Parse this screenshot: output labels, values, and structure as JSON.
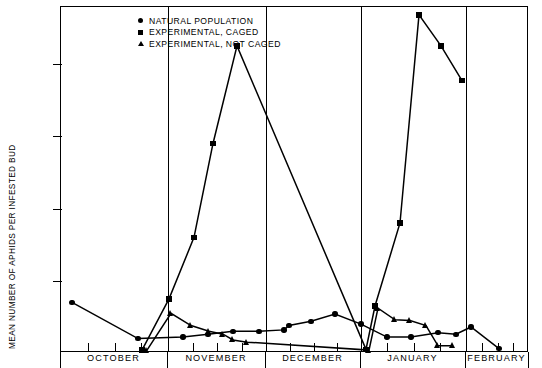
{
  "chart_data": {
    "type": "line",
    "title": "",
    "xlabel": "",
    "ylabel": "MEAN NUMBER OF APHIDS PER INFESTED BUD",
    "ylim": [
      0,
      470
    ],
    "yticks": [
      0,
      100,
      200,
      300,
      400
    ],
    "ytick_labels": [
      "0",
      "100",
      "200",
      "300",
      "400"
    ],
    "grid": false,
    "legend_position": "top-left",
    "xaxis": {
      "type": "time",
      "month_bands": [
        "OCTOBER",
        "NOVEMBER",
        "DECEMBER",
        "JANUARY",
        "FEBRUARY"
      ],
      "band_boundaries_px": [
        60,
        167,
        265,
        360,
        465,
        528
      ],
      "tick_interval": "weekly"
    },
    "series": [
      {
        "name": "NATURAL POPULATION",
        "marker": "circle",
        "points": [
          {
            "x": 71,
            "y": 70
          },
          {
            "x": 137,
            "y": 20
          },
          {
            "x": 182,
            "y": 22
          },
          {
            "x": 207,
            "y": 26
          },
          {
            "x": 232,
            "y": 30
          },
          {
            "x": 258,
            "y": 30
          },
          {
            "x": 283,
            "y": 32
          },
          {
            "x": 288,
            "y": 38
          },
          {
            "x": 310,
            "y": 44
          },
          {
            "x": 334,
            "y": 54
          },
          {
            "x": 360,
            "y": 40
          },
          {
            "x": 386,
            "y": 22
          },
          {
            "x": 410,
            "y": 22
          },
          {
            "x": 437,
            "y": 28
          },
          {
            "x": 455,
            "y": 26
          },
          {
            "x": 470,
            "y": 36
          },
          {
            "x": 498,
            "y": 6
          }
        ]
      },
      {
        "name": "EXPERIMENTAL, CAGED",
        "marker": "square",
        "points": [
          {
            "x": 141,
            "y": 4
          },
          {
            "x": 168,
            "y": 75
          },
          {
            "x": 193,
            "y": 160
          },
          {
            "x": 212,
            "y": 290
          },
          {
            "x": 236,
            "y": 425
          },
          {
            "x": 365,
            "y": 5
          },
          {
            "x": 374,
            "y": 65
          },
          {
            "x": 399,
            "y": 180
          },
          {
            "x": 418,
            "y": 468
          },
          {
            "x": 440,
            "y": 425
          },
          {
            "x": 461,
            "y": 377
          }
        ]
      },
      {
        "name": "EXPERIMENTAL, NOT CAGED",
        "marker": "triangle",
        "points": [
          {
            "x": 146,
            "y": 4
          },
          {
            "x": 170,
            "y": 55
          },
          {
            "x": 190,
            "y": 38
          },
          {
            "x": 208,
            "y": 30
          },
          {
            "x": 222,
            "y": 26
          },
          {
            "x": 232,
            "y": 18
          },
          {
            "x": 246,
            "y": 15
          },
          {
            "x": 368,
            "y": 4
          },
          {
            "x": 377,
            "y": 62
          },
          {
            "x": 394,
            "y": 46
          },
          {
            "x": 409,
            "y": 45
          },
          {
            "x": 425,
            "y": 38
          },
          {
            "x": 437,
            "y": 10
          },
          {
            "x": 452,
            "y": 10
          }
        ]
      }
    ]
  },
  "legend": {
    "items": [
      {
        "marker": "circle",
        "label": "NATURAL POPULATION"
      },
      {
        "marker": "square",
        "label": "EXPERIMENTAL, CAGED"
      },
      {
        "marker": "triangle",
        "label": "EXPERIMENTAL, NOT CAGED"
      }
    ]
  }
}
